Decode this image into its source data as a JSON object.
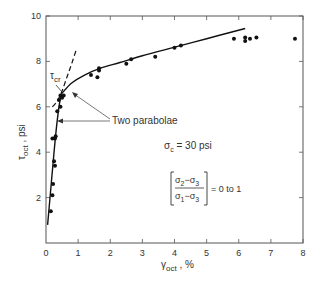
{
  "chart_data": {
    "type": "scatter",
    "title": "",
    "xlabel": "γoct , %",
    "ylabel": "τoct , psi",
    "xlim": [
      0,
      8
    ],
    "ylim": [
      0,
      10
    ],
    "x_ticks": [
      "0",
      "1",
      "2",
      "3",
      "4",
      "5",
      "6",
      "7",
      "8"
    ],
    "y_ticks": [
      "2",
      "4",
      "6",
      "8",
      "10"
    ],
    "grid": false,
    "series": [
      {
        "name": "Test data",
        "kind": "points",
        "x": [
          0.15,
          0.2,
          0.22,
          0.28,
          0.25,
          0.2,
          0.3,
          0.28,
          0.35,
          0.45,
          0.4,
          0.45,
          0.55,
          0.5,
          1.4,
          1.6,
          1.65,
          1.65,
          2.5,
          2.65,
          3.4,
          4.0,
          4.2,
          5.85,
          6.2,
          6.2,
          6.35,
          6.55,
          7.75
        ],
        "y": [
          1.4,
          2.1,
          2.6,
          3.4,
          3.6,
          4.6,
          4.7,
          4.6,
          5.8,
          6.0,
          6.3,
          6.5,
          6.5,
          6.4,
          7.4,
          7.3,
          7.6,
          7.7,
          7.9,
          8.1,
          8.2,
          8.6,
          8.7,
          9.0,
          9.05,
          8.9,
          9.0,
          9.05,
          9.0
        ]
      },
      {
        "name": "Initial parabola",
        "kind": "solid-line",
        "x": [
          0.05,
          0.15,
          0.25,
          0.35,
          0.45,
          0.5
        ],
        "y": [
          0.8,
          2.4,
          4.0,
          5.4,
          6.4,
          6.6
        ]
      },
      {
        "name": "Second parabola",
        "kind": "solid-line",
        "x": [
          0.5,
          0.8,
          1.2,
          1.7,
          2.3,
          3.0,
          3.8,
          4.6,
          5.4,
          6.2
        ],
        "y": [
          6.6,
          7.05,
          7.4,
          7.7,
          7.95,
          8.25,
          8.55,
          8.85,
          9.15,
          9.45
        ]
      },
      {
        "name": "Extension of initial parabola",
        "kind": "dashed-line",
        "x": [
          0.2,
          0.35,
          0.5,
          0.65,
          0.8,
          0.95
        ],
        "y": [
          6.0,
          6.25,
          6.7,
          7.3,
          7.9,
          8.55
        ]
      }
    ],
    "annotations": [
      {
        "text": "τcr",
        "x": 0.25,
        "y": 7.2
      },
      {
        "text": "Two parabolae",
        "x": 3.2,
        "y": 5.4
      },
      {
        "text": "σc = 30 psi",
        "x": 3.55,
        "y": 4.35
      },
      {
        "text": "[(σ2 − σ3)/(σ1 − σ3)] = 0 to 1",
        "x": 3.7,
        "y": 2.8
      }
    ]
  },
  "labels": {
    "xlabel_main": "γ",
    "xlabel_sub": "oct",
    "xlabel_unit": " ,  %",
    "ylabel_main": "τ",
    "ylabel_sub": "oct",
    "ylabel_unit": " , psi",
    "tcr_main": "τ",
    "tcr_sub": "cr",
    "two_parabolae": "Two  parabolae",
    "sigma_c_main": "σ",
    "sigma_c_sub": "c",
    "sigma_c_value": " = 30 psi",
    "ratio_num_a": "σ",
    "ratio_num_a_sub": "2",
    "ratio_minus": "−",
    "ratio_num_b": "σ",
    "ratio_num_b_sub": "3",
    "ratio_den_a": "σ",
    "ratio_den_a_sub": "1",
    "ratio_den_b": "σ",
    "ratio_den_b_sub": "3",
    "ratio_value": "=  0  to  1"
  },
  "colors": {
    "ink": "#222222",
    "axis": "#444444",
    "background": "#ffffff"
  }
}
